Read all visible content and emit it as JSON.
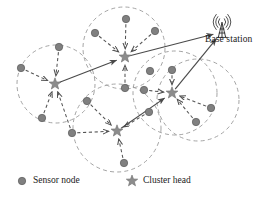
{
  "figure": {
    "type": "diagram",
    "background": "#ffffff"
  },
  "colors": {
    "node_fill": "#808080",
    "node_stroke": "#5a5a5a",
    "star_fill": "#8c8c8c",
    "star_stroke": "#6e6e6e",
    "circle_stroke": "#9a9a9a",
    "solid_link": "#4a4a4a",
    "dashed_link": "#555555",
    "text": "#1a1a1a",
    "tower": "#3c3c3c"
  },
  "base_station": {
    "label": "Base station",
    "icon": "antenna-tower-icon",
    "x": 222,
    "y": 22
  },
  "legend": {
    "items": [
      {
        "marker": "circle",
        "icon": "sensor-node-icon",
        "label": "Sensor node",
        "x": 22,
        "y": 181
      },
      {
        "marker": "star",
        "icon": "cluster-head-icon",
        "label": "Cluster head",
        "x": 132,
        "y": 181
      }
    ]
  },
  "clusters": [
    {
      "id": "cluster-left",
      "cx": 56,
      "cy": 84,
      "r": 39
    },
    {
      "id": "cluster-top",
      "cx": 124,
      "cy": 48,
      "r": 41
    },
    {
      "id": "cluster-right",
      "cx": 175,
      "cy": 93,
      "r": 42
    },
    {
      "id": "cluster-bottom",
      "cx": 117,
      "cy": 128,
      "r": 44
    },
    {
      "id": "cluster-far-right",
      "cx": 198,
      "cy": 100,
      "r": 41
    }
  ],
  "cluster_heads": [
    {
      "id": "head-left",
      "x": 55,
      "y": 84
    },
    {
      "id": "head-top",
      "x": 125,
      "y": 57
    },
    {
      "id": "head-right",
      "x": 172,
      "y": 93
    },
    {
      "id": "head-bottom",
      "x": 117,
      "y": 131
    }
  ],
  "sensor_nodes": [
    {
      "id": "n1",
      "x": 21,
      "y": 68
    },
    {
      "id": "n2",
      "x": 59,
      "y": 47
    },
    {
      "id": "n3",
      "x": 42,
      "y": 118
    },
    {
      "id": "n4",
      "x": 72,
      "y": 133
    },
    {
      "id": "n5",
      "x": 95,
      "y": 33
    },
    {
      "id": "n6",
      "x": 126,
      "y": 19
    },
    {
      "id": "n7",
      "x": 155,
      "y": 31
    },
    {
      "id": "n8",
      "x": 125,
      "y": 88
    },
    {
      "id": "n9",
      "x": 150,
      "y": 71
    },
    {
      "id": "n10",
      "x": 87,
      "y": 101
    },
    {
      "id": "n11",
      "x": 124,
      "y": 163
    },
    {
      "id": "n12",
      "x": 144,
      "y": 90
    },
    {
      "id": "n13",
      "x": 172,
      "y": 70
    },
    {
      "id": "n14",
      "x": 196,
      "y": 122
    },
    {
      "id": "n15",
      "x": 211,
      "y": 108
    },
    {
      "id": "n16",
      "x": 149,
      "y": 112
    }
  ],
  "member_links": [
    {
      "from": "n1",
      "to": "head-left"
    },
    {
      "from": "n2",
      "to": "head-left"
    },
    {
      "from": "n3",
      "to": "head-left"
    },
    {
      "from": "n4",
      "to": "head-left"
    },
    {
      "from": "n5",
      "to": "head-top"
    },
    {
      "from": "n6",
      "to": "head-top"
    },
    {
      "from": "n7",
      "to": "head-top"
    },
    {
      "from": "n8",
      "to": "head-top"
    },
    {
      "from": "n12",
      "to": "head-right"
    },
    {
      "from": "n13",
      "to": "head-right"
    },
    {
      "from": "n14",
      "to": "head-right"
    },
    {
      "from": "n15",
      "to": "head-right"
    },
    {
      "from": "n10",
      "to": "head-bottom"
    },
    {
      "from": "n11",
      "to": "head-bottom"
    },
    {
      "from": "n4",
      "to": "head-bottom"
    },
    {
      "from": "n16",
      "to": "head-bottom"
    }
  ],
  "backbone_links": [
    {
      "from": "head-left",
      "to": "head-top",
      "style": "solid"
    },
    {
      "from": "head-top",
      "to": "base-station",
      "style": "solid"
    },
    {
      "from": "head-bottom",
      "to": "head-right",
      "style": "solid"
    },
    {
      "from": "head-right",
      "to": "base-station",
      "style": "solid"
    }
  ]
}
